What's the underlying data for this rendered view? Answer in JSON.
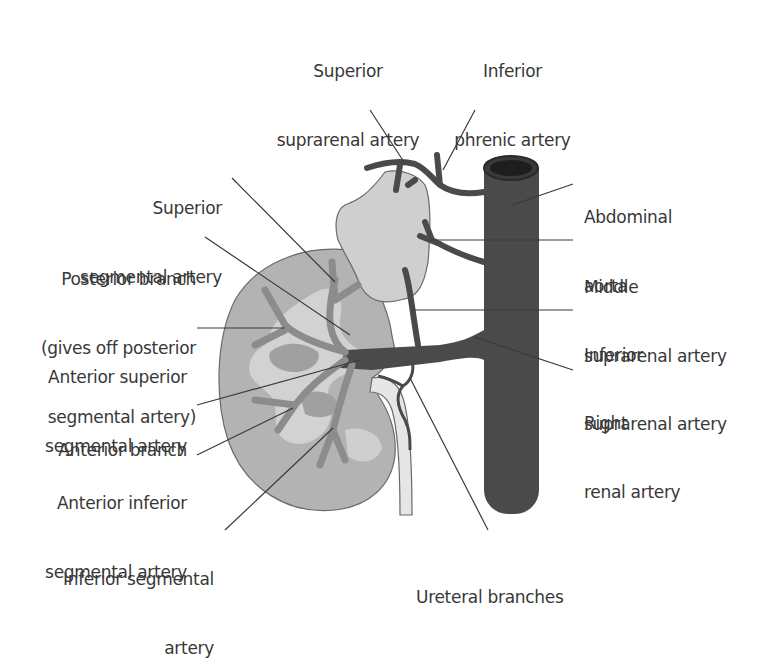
{
  "figure": {
    "colors": {
      "background": "#ffffff",
      "kidney_cortex": "#b3b3b3",
      "kidney_medulla": "#a3a3a3",
      "renal_sinus": "#d4d4d4",
      "suprarenal_gland": "#cfcfcf",
      "aorta": "#4a4a4a",
      "segmental_arteries": "#8c8c8c",
      "ureter": "#e6e6e6",
      "leader_lines": "#3a3a3a",
      "label_text": "#383838"
    }
  },
  "labels": {
    "superior_suprarenal": {
      "line1": "Superior",
      "line2": "suprarenal artery"
    },
    "inferior_phrenic": {
      "line1": "Inferior",
      "line2": "phrenic artery"
    },
    "superior_segmental": {
      "line1": "Superior",
      "line2": "segmental artery"
    },
    "posterior_branch": {
      "line1": "Posterior branch",
      "line2": "(gives off posterior",
      "line3": "segmental artery)"
    },
    "anterior_superior_segmental": {
      "line1": "Anterior superior",
      "line2": "segmental artery"
    },
    "anterior_branch": {
      "line1": "Anterior branch"
    },
    "anterior_inferior_segmental": {
      "line1": "Anterior inferior",
      "line2": "segmental artery"
    },
    "inferior_segmental": {
      "line1": "Inferior segmental",
      "line2": "artery"
    },
    "abdominal_aorta": {
      "line1": "Abdominal",
      "line2": "aorta"
    },
    "middle_suprarenal": {
      "line1": "Middle",
      "line2": "suprarenal artery"
    },
    "inferior_suprarenal": {
      "line1": "Inferior",
      "line2": "suprarenal artery"
    },
    "right_renal": {
      "line1": "Right",
      "line2": "renal artery"
    },
    "ureteral_branches": {
      "line1": "Ureteral branches"
    }
  }
}
